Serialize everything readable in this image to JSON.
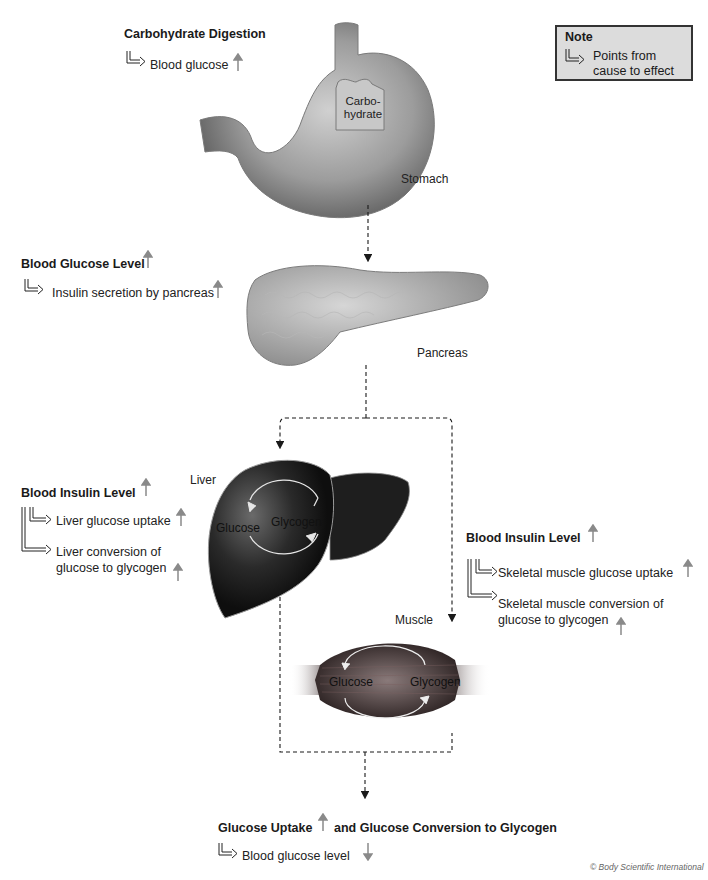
{
  "note": {
    "title": "Note",
    "text_line1": "Points from",
    "text_line2": "cause to effect",
    "icon": "bracket-arrow-icon"
  },
  "stage1": {
    "heading": "Carbohydrate Digestion",
    "effect": "Blood glucose",
    "effect_direction": "up"
  },
  "stomach": {
    "label": "Stomach",
    "food_label_line1": "Carbo-",
    "food_label_line2": "hydrate"
  },
  "stage2": {
    "heading": "Blood Glucose Level",
    "heading_direction": "up",
    "effect": "Insulin secretion by pancreas",
    "effect_direction": "up"
  },
  "pancreas": {
    "label": "Pancreas"
  },
  "liver_panel": {
    "heading": "Blood Insulin Level",
    "heading_direction": "up",
    "effects": [
      {
        "line1": "Liver glucose uptake",
        "line2": "",
        "direction": "up"
      },
      {
        "line1": "Liver conversion of",
        "line2": "glucose to glycogen",
        "direction": "up"
      }
    ]
  },
  "liver": {
    "label": "Liver",
    "cycle_left": "Glucose",
    "cycle_right": "Glycogen"
  },
  "muscle_panel": {
    "heading": "Blood Insulin Level",
    "heading_direction": "up",
    "effects": [
      {
        "line1": "Skeletal muscle glucose uptake",
        "line2": "",
        "direction": "up"
      },
      {
        "line1": "Skeletal muscle conversion of",
        "line2": "glucose to glycogen",
        "direction": "up"
      }
    ]
  },
  "muscle": {
    "label": "Muscle",
    "cycle_left": "Glucose",
    "cycle_right": "Glycogen"
  },
  "outcome": {
    "heading_part1": "Glucose Uptake",
    "heading_part1_direction": "up",
    "heading_part2": "and Glucose Conversion to Glycogen",
    "effect": "Blood glucose level",
    "effect_direction": "down"
  },
  "colors": {
    "arrow_gray": "#8a8a8a",
    "note_bg": "#dcdcdc",
    "liver": "#1c1c1c",
    "muscle": "#4a4040",
    "organ_gray": "#9a9a9a"
  },
  "copyright": "© Body Scientific International"
}
